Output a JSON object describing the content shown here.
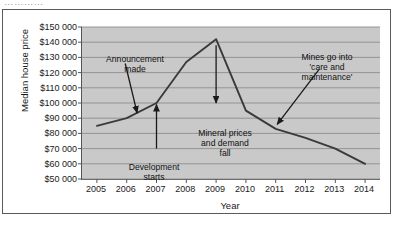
{
  "cut_title": "…………",
  "chart_data": {
    "type": "line",
    "title": "",
    "xlabel": "Year",
    "ylabel": "Median house price",
    "categories": [
      "2005",
      "2006",
      "2007",
      "2008",
      "2009",
      "2010",
      "2011",
      "2012",
      "2013",
      "2014"
    ],
    "x": [
      2005,
      2006,
      2007,
      2008,
      2009,
      2010,
      2011,
      2012,
      2013,
      2014
    ],
    "values": [
      85000,
      90000,
      100000,
      127000,
      142000,
      95000,
      83000,
      77000,
      70000,
      60000
    ],
    "xlim": [
      2004.5,
      2014.5
    ],
    "ylim": [
      50000,
      150000
    ],
    "ytick_values": [
      150000,
      140000,
      130000,
      120000,
      110000,
      100000,
      90000,
      80000,
      70000,
      60000,
      50000
    ],
    "ytick_labels": [
      "$150 000",
      "$140 000",
      "$130 000",
      "$120 000",
      "$110 000",
      "$100 000",
      "$90 000",
      "$80 000",
      "$70 000",
      "$60 000",
      "$50 000"
    ],
    "grid": true,
    "legend": false,
    "plot_background": "#c9c9c9",
    "line_color": "#3a3a3a",
    "gridline_color": "#8d8d8d",
    "annotations": [
      {
        "id": "announcement",
        "text": "Announcement\nmade",
        "target_x": 2006.35,
        "target_y": 92000,
        "arrow": "down"
      },
      {
        "id": "development",
        "text": "Development\nstarts",
        "target_x": 2007.0,
        "target_y": 101000,
        "arrow": "up"
      },
      {
        "id": "mineral",
        "text": "Mineral prices\nand demand\nfall",
        "target_x": 2009.0,
        "target_y": 102000,
        "arrow": "down"
      },
      {
        "id": "mines",
        "text": "Mines go into\n'care and\nmaintenance'",
        "target_x": 2011.0,
        "target_y": 84000,
        "arrow": "down-left"
      }
    ]
  }
}
